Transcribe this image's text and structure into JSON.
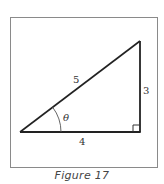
{
  "figure": {
    "caption": "Figure 17",
    "frame": {
      "x": 10,
      "y": 17,
      "width": 148,
      "height": 151,
      "stroke": "#888888"
    },
    "triangle": {
      "vertices": {
        "left": [
          20,
          132
        ],
        "right": [
          140,
          132
        ],
        "top": [
          140,
          41
        ]
      },
      "stroke": "#222222",
      "right_angle_marker_size": 7,
      "angle_arc_radius": 41
    },
    "labels": {
      "hypotenuse": "5",
      "opposite": "3",
      "adjacent": "4",
      "angle": "θ"
    }
  }
}
